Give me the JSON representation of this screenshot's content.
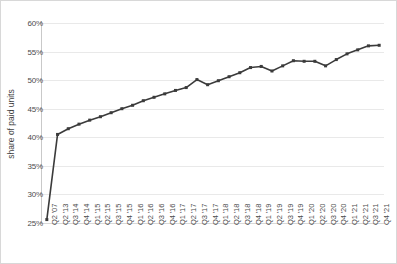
{
  "chart_data": {
    "type": "line",
    "title": "",
    "xlabel": "",
    "ylabel": "share of paid units",
    "ylim": [
      25,
      60
    ],
    "ytick_values": [
      25,
      30,
      35,
      40,
      45,
      50,
      55,
      60
    ],
    "ytick_labels": [
      "25%",
      "30%",
      "35%",
      "40%",
      "45%",
      "50%",
      "55%",
      "60%"
    ],
    "grid": "horizontal",
    "legend": "none",
    "line_color": "#3b3b3b",
    "marker": "square",
    "marker_color": "#3b3b3b",
    "categories": [
      "Q2 '07",
      "Q2 '13",
      "Q3 '14",
      "Q4 '14",
      "Q1 '15",
      "Q2 '15",
      "Q3 '15",
      "Q4 '15",
      "Q1 '16",
      "Q2 '16",
      "Q3 '16",
      "Q4 '16",
      "Q1 '17",
      "Q2 '17",
      "Q3 '17",
      "Q4 '17",
      "Q1 '18",
      "Q2 '18",
      "Q3 '18",
      "Q4 '18",
      "Q1 '19",
      "Q2 '19",
      "Q3 '19",
      "Q4 '19",
      "Q1 '20",
      "Q2 '20",
      "Q3 '20",
      "Q4 '20",
      "Q1 '21",
      "Q2 '21",
      "Q3 '21",
      "Q4 '21"
    ],
    "values": [
      25.6,
      40.5,
      41.5,
      42.3,
      43.0,
      43.6,
      44.3,
      45.0,
      45.6,
      46.4,
      47.0,
      47.6,
      48.2,
      48.7,
      50.1,
      49.2,
      49.9,
      50.6,
      51.3,
      52.2,
      52.4,
      51.6,
      52.5,
      53.4,
      53.3,
      53.3,
      52.5,
      53.6,
      54.6,
      55.3,
      56.0,
      56.1
    ]
  }
}
